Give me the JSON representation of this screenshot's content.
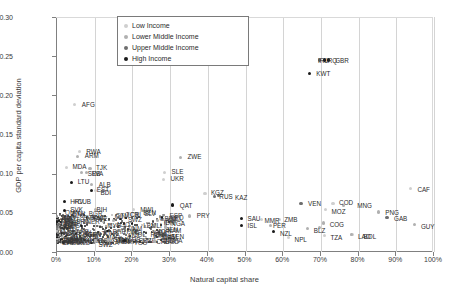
{
  "chart_data": {
    "type": "scatter",
    "title": "",
    "xlabel": "Natural capital share",
    "ylabel": "GDP per capita standard deviation",
    "xlim": [
      0,
      1.0
    ],
    "ylim": [
      0,
      0.3
    ],
    "xticks": [
      "0%",
      "10%",
      "20%",
      "30%",
      "40%",
      "50%",
      "60%",
      "70%",
      "80%",
      "90%",
      "100%"
    ],
    "yticks": [
      "0.00",
      "0.05",
      "0.10",
      "0.15",
      "0.20",
      "0.25",
      "0.30"
    ],
    "grid": "vertical",
    "legend_position": "top-center",
    "series": [
      {
        "name": "Low Income",
        "color": "#cfcfcf",
        "points": [
          {
            "label": "AFG",
            "x": 0.05,
            "y": 0.188
          },
          {
            "label": "RWA",
            "x": 0.062,
            "y": 0.128
          },
          {
            "label": "MDA",
            "x": 0.028,
            "y": 0.108
          },
          {
            "label": "SLE",
            "x": 0.288,
            "y": 0.102
          },
          {
            "label": "UKR",
            "x": 0.285,
            "y": 0.093
          },
          {
            "label": "BDI",
            "x": 0.105,
            "y": 0.078
          },
          {
            "label": "KGZ",
            "x": 0.395,
            "y": 0.075
          },
          {
            "label": "MWI",
            "x": 0.205,
            "y": 0.054
          },
          {
            "label": "COD",
            "x": 0.735,
            "y": 0.062
          },
          {
            "label": "MOZ",
            "x": 0.715,
            "y": 0.054
          },
          {
            "label": "ZMB",
            "x": 0.592,
            "y": 0.041
          },
          {
            "label": "MMR",
            "x": 0.545,
            "y": 0.041
          },
          {
            "label": "NPL",
            "x": 0.617,
            "y": 0.018
          },
          {
            "label": "TZA",
            "x": 0.712,
            "y": 0.021
          },
          {
            "label": "LAO",
            "x": 0.785,
            "y": 0.022
          },
          {
            "label": "MLI",
            "x": 0.258,
            "y": 0.033
          },
          {
            "label": "SEN",
            "x": 0.3,
            "y": 0.024
          },
          {
            "label": "GHA",
            "x": 0.29,
            "y": 0.034
          },
          {
            "label": "CAF",
            "x": 0.94,
            "y": 0.081
          }
        ]
      },
      {
        "name": "Lower Middle Income",
        "color": "#b0b0b0",
        "points": [
          {
            "label": "ARM",
            "x": 0.058,
            "y": 0.122
          },
          {
            "label": "TJK",
            "x": 0.09,
            "y": 0.107
          },
          {
            "label": "SRB",
            "x": 0.068,
            "y": 0.101
          },
          {
            "label": "LVA",
            "x": 0.08,
            "y": 0.101
          },
          {
            "label": "ALB",
            "x": 0.095,
            "y": 0.086
          },
          {
            "label": "ZWE",
            "x": 0.33,
            "y": 0.121
          },
          {
            "label": "CUB",
            "x": 0.052,
            "y": 0.064
          },
          {
            "label": "BOL",
            "x": 0.783,
            "y": 0.022
          },
          {
            "label": "BIH",
            "x": 0.105,
            "y": 0.054
          },
          {
            "label": "PRY",
            "x": 0.355,
            "y": 0.046
          },
          {
            "label": "IDN",
            "x": 0.27,
            "y": 0.04
          },
          {
            "label": "NGA",
            "x": 0.29,
            "y": 0.038
          },
          {
            "label": "NAM",
            "x": 0.29,
            "y": 0.032
          },
          {
            "label": "VNM",
            "x": 0.262,
            "y": 0.014
          },
          {
            "label": "GTM",
            "x": 0.14,
            "y": 0.015
          },
          {
            "label": "SWZ",
            "x": 0.105,
            "y": 0.014
          },
          {
            "label": "MNG",
            "x": 0.762,
            "y": 0.059
          },
          {
            "label": "PNG",
            "x": 0.855,
            "y": 0.051
          },
          {
            "label": "GUY",
            "x": 0.952,
            "y": 0.035
          },
          {
            "label": "COG",
            "x": 0.71,
            "y": 0.037
          },
          {
            "label": "BLZ",
            "x": 0.668,
            "y": 0.03
          },
          {
            "label": "ZMB2",
            "x": 0.7,
            "y": 0.031
          },
          {
            "label": "PER",
            "x": 0.57,
            "y": 0.034
          },
          {
            "label": "MYS",
            "x": 0.152,
            "y": 0.04
          }
        ]
      },
      {
        "name": "Upper Middle Income",
        "color": "#6e6e6e",
        "points": [
          {
            "label": "RUS",
            "x": 0.42,
            "y": 0.071
          },
          {
            "label": "KAZ",
            "x": 0.43,
            "y": 0.072
          },
          {
            "label": "VEN",
            "x": 0.65,
            "y": 0.062
          },
          {
            "label": "GAB",
            "x": 0.878,
            "y": 0.044
          },
          {
            "label": "IRQ",
            "x": 0.7,
            "y": 0.245
          },
          {
            "label": "BRA",
            "x": 0.182,
            "y": 0.03
          }
        ]
      },
      {
        "name": "High Income",
        "color": "#1a1a1a",
        "points": [
          {
            "label": "KWT",
            "x": 0.672,
            "y": 0.228
          },
          {
            "label": "GBR",
            "x": 0.722,
            "y": 0.245
          },
          {
            "label": "LTU",
            "x": 0.042,
            "y": 0.089
          },
          {
            "label": "EST",
            "x": 0.095,
            "y": 0.079
          },
          {
            "label": "HRV",
            "x": 0.022,
            "y": 0.064
          },
          {
            "label": "SVK",
            "x": 0.022,
            "y": 0.053
          },
          {
            "label": "QAT",
            "x": 0.31,
            "y": 0.06
          },
          {
            "label": "SAU",
            "x": 0.492,
            "y": 0.043
          },
          {
            "label": "ISL",
            "x": 0.492,
            "y": 0.034
          },
          {
            "label": "NZL",
            "x": 0.578,
            "y": 0.026
          },
          {
            "label": "AUS",
            "x": 0.182,
            "y": 0.015
          },
          {
            "label": "IRL",
            "x": 0.712,
            "y": 0.245
          }
        ]
      }
    ],
    "annotations": [
      {
        "text": "AFG",
        "x": 0.05,
        "y": 0.188,
        "dx": 7,
        "dy": -3
      },
      {
        "text": "RWA",
        "x": 0.062,
        "y": 0.128,
        "dx": 7,
        "dy": -3
      },
      {
        "text": "ARM",
        "x": 0.058,
        "y": 0.122,
        "dx": 7,
        "dy": -3
      },
      {
        "text": "MDA",
        "x": 0.028,
        "y": 0.108,
        "dx": 6,
        "dy": -3
      },
      {
        "text": "TJK",
        "x": 0.09,
        "y": 0.107,
        "dx": 6,
        "dy": -3
      },
      {
        "text": "SRB",
        "x": 0.068,
        "y": 0.101,
        "dx": 6,
        "dy": -2
      },
      {
        "text": "LVA",
        "x": 0.08,
        "y": 0.101,
        "dx": 6,
        "dy": -2
      },
      {
        "text": "ZWE",
        "x": 0.33,
        "y": 0.121,
        "dx": 7,
        "dy": -3
      },
      {
        "text": "SLE",
        "x": 0.288,
        "y": 0.102,
        "dx": 7,
        "dy": -3
      },
      {
        "text": "UKR",
        "x": 0.285,
        "y": 0.093,
        "dx": 7,
        "dy": -3
      },
      {
        "text": "LTU",
        "x": 0.042,
        "y": 0.089,
        "dx": 6,
        "dy": -3
      },
      {
        "text": "ALB",
        "x": 0.095,
        "y": 0.086,
        "dx": 7,
        "dy": -3
      },
      {
        "text": "EST",
        "x": 0.095,
        "y": 0.079,
        "dx": 5,
        "dy": -3
      },
      {
        "text": "BDI",
        "x": 0.105,
        "y": 0.078,
        "dx": 5,
        "dy": -1
      },
      {
        "text": "KGZ",
        "x": 0.395,
        "y": 0.075,
        "dx": 6,
        "dy": -3
      },
      {
        "text": "RUS",
        "x": 0.42,
        "y": 0.071,
        "dx": 5,
        "dy": -2
      },
      {
        "text": "KAZ",
        "x": 0.43,
        "y": 0.072,
        "dx": 17,
        "dy": -1
      },
      {
        "text": "HRV",
        "x": 0.022,
        "y": 0.064,
        "dx": 6,
        "dy": -3
      },
      {
        "text": "CUB",
        "x": 0.052,
        "y": 0.064,
        "dx": 2,
        "dy": -3
      },
      {
        "text": "SVK",
        "x": 0.022,
        "y": 0.053,
        "dx": 6,
        "dy": -3
      },
      {
        "text": "BIH",
        "x": 0.105,
        "y": 0.054,
        "dx": 1,
        "dy": -3
      },
      {
        "text": "MWI",
        "x": 0.205,
        "y": 0.054,
        "dx": 7,
        "dy": -3
      },
      {
        "text": "QAT",
        "x": 0.31,
        "y": 0.06,
        "dx": 7,
        "dy": -2
      },
      {
        "text": "VEN",
        "x": 0.65,
        "y": 0.062,
        "dx": 7,
        "dy": -2
      },
      {
        "text": "COD",
        "x": 0.735,
        "y": 0.062,
        "dx": 6,
        "dy": -3
      },
      {
        "text": "MNG",
        "x": 0.762,
        "y": 0.059,
        "dx": 14,
        "dy": 0
      },
      {
        "text": "MOZ",
        "x": 0.715,
        "y": 0.054,
        "dx": 6,
        "dy": -1
      },
      {
        "text": "CAF",
        "x": 0.94,
        "y": 0.081,
        "dx": 7,
        "dy": -2
      },
      {
        "text": "PNG",
        "x": 0.855,
        "y": 0.051,
        "dx": 7,
        "dy": -2
      },
      {
        "text": "GAB",
        "x": 0.878,
        "y": 0.044,
        "dx": 7,
        "dy": -2
      },
      {
        "text": "GUY",
        "x": 0.952,
        "y": 0.035,
        "dx": 6,
        "dy": -1
      },
      {
        "text": "PRY",
        "x": 0.355,
        "y": 0.046,
        "dx": 7,
        "dy": -3
      },
      {
        "text": "SAU",
        "x": 0.492,
        "y": 0.043,
        "dx": 6,
        "dy": -2
      },
      {
        "text": "ZMB",
        "x": 0.592,
        "y": 0.041,
        "dx": 5,
        "dy": -3
      },
      {
        "text": "MMR",
        "x": 0.545,
        "y": 0.041,
        "dx": 3,
        "dy": -2
      },
      {
        "text": "ISL",
        "x": 0.492,
        "y": 0.034,
        "dx": 6,
        "dy": -2
      },
      {
        "text": "PER",
        "x": 0.57,
        "y": 0.034,
        "dx": 2,
        "dy": -2
      },
      {
        "text": "COG",
        "x": 0.71,
        "y": 0.037,
        "dx": 6,
        "dy": -1
      },
      {
        "text": "BLZ",
        "x": 0.668,
        "y": 0.03,
        "dx": 6,
        "dy": -1
      },
      {
        "text": "NZL",
        "x": 0.578,
        "y": 0.026,
        "dx": 6,
        "dy": -1
      },
      {
        "text": "NPL",
        "x": 0.617,
        "y": 0.018,
        "dx": 6,
        "dy": -1
      },
      {
        "text": "TZA",
        "x": 0.712,
        "y": 0.021,
        "dx": 6,
        "dy": -1
      },
      {
        "text": "LAO",
        "x": 0.785,
        "y": 0.022,
        "dx": 6,
        "dy": -1
      },
      {
        "text": "BOL",
        "x": 0.8,
        "y": 0.022,
        "dx": 6,
        "dy": -1
      },
      {
        "text": "KWT",
        "x": 0.672,
        "y": 0.228,
        "dx": 7,
        "dy": -2
      },
      {
        "text": "IRQ",
        "x": 0.7,
        "y": 0.245,
        "dx": 6,
        "dy": -2
      },
      {
        "text": "GBR",
        "x": 0.722,
        "y": 0.245,
        "dx": 7,
        "dy": -2
      },
      {
        "text": "IDN",
        "x": 0.27,
        "y": 0.04,
        "dx": 6,
        "dy": -1
      },
      {
        "text": "NGA",
        "x": 0.29,
        "y": 0.038,
        "dx": 6,
        "dy": -1
      },
      {
        "text": "MLI",
        "x": 0.258,
        "y": 0.033,
        "dx": -2,
        "dy": 0
      },
      {
        "text": "NAM",
        "x": 0.29,
        "y": 0.032,
        "dx": 2,
        "dy": 1
      },
      {
        "text": "SEN",
        "x": 0.3,
        "y": 0.024,
        "dx": 2,
        "dy": 1
      },
      {
        "text": "VNM",
        "x": 0.262,
        "y": 0.014,
        "dx": 6,
        "dy": 0
      },
      {
        "text": "AUS",
        "x": 0.182,
        "y": 0.015,
        "dx": 3,
        "dy": 0
      },
      {
        "text": "GTM",
        "x": 0.14,
        "y": 0.015,
        "dx": 4,
        "dy": 0
      },
      {
        "text": "SWZ",
        "x": 0.105,
        "y": 0.014,
        "dx": 3,
        "dy": 1
      },
      {
        "text": "MYS",
        "x": 0.152,
        "y": 0.04,
        "dx": -6,
        "dy": 2
      },
      {
        "text": "IRL",
        "x": 0.7,
        "y": 0.245,
        "dx": -2,
        "dy": -2
      }
    ]
  },
  "legend": {
    "items": [
      {
        "label": "Low Income",
        "color": "#cfcfcf"
      },
      {
        "label": "Lower Middle Income",
        "color": "#b0b0b0"
      },
      {
        "label": "Upper Middle Income",
        "color": "#6e6e6e"
      },
      {
        "label": "High Income",
        "color": "#1a1a1a"
      }
    ]
  },
  "dense_cluster_labels": [
    "HRV",
    "CUB",
    "SVK",
    "BOL",
    "BIH",
    "MARE",
    "MWI",
    "IRQ",
    "TO",
    "MYS",
    "CHN",
    "BRA",
    "ECU",
    "DZA",
    "EGY",
    "IND",
    "PHL",
    "THA",
    "TUR",
    "ZAF",
    "MEX",
    "COL",
    "ARG",
    "CHL",
    "MAR",
    "TUN",
    "JOR",
    "LKA",
    "PAK",
    "BGD",
    "KEN",
    "UGA",
    "ETH",
    "CMR",
    "CIV",
    "GIN",
    "TGO",
    "BEN",
    "NER",
    "TCD",
    "SDN",
    "SYR",
    "YEM",
    "OMN",
    "BHR",
    "ARE",
    "LBY",
    "AGO",
    "NIC",
    "HND",
    "SLV",
    "CRI",
    "PAN",
    "DOM",
    "JAM",
    "URY",
    "PRT",
    "ESP",
    "GRC",
    "ITA",
    "FRA",
    "DEU",
    "POL",
    "CZE",
    "HUN",
    "ROU",
    "BGR",
    "SVN",
    "FIN",
    "SWE",
    "NOR",
    "DNK",
    "NLD",
    "BEL",
    "AUT",
    "CHE",
    "GBR2",
    "USA",
    "CAN",
    "JPN",
    "KOR",
    "SGP",
    "ISR",
    "SWZ",
    "GTM",
    "AUS",
    "VNM",
    "SEN",
    "NAM",
    "MLI",
    "GHA"
  ]
}
